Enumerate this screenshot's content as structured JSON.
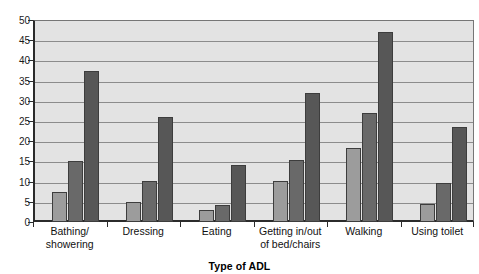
{
  "chart_data": {
    "type": "bar",
    "title": "",
    "xlabel": "Type of ADL",
    "ylabel": "",
    "ylim": [
      0,
      50
    ],
    "yticks": [
      0,
      5,
      10,
      15,
      20,
      25,
      30,
      35,
      40,
      45,
      50
    ],
    "ytick_labels": [
      "0",
      "5",
      "10",
      "15",
      "20",
      "25",
      "30",
      "35",
      "40",
      "45",
      "50"
    ],
    "grid": true,
    "legend": "none",
    "categories": [
      "Bathing/\nshowering",
      "Dressing",
      "Eating",
      "Getting in/out\nof bed/chairs",
      "Walking",
      "Using toilet"
    ],
    "category_lines": [
      [
        "Bathing/",
        "showering"
      ],
      [
        "Dressing",
        ""
      ],
      [
        "Eating",
        ""
      ],
      [
        "Getting in/out",
        "of bed/chairs"
      ],
      [
        "Walking",
        ""
      ],
      [
        "Using toilet",
        ""
      ]
    ],
    "series": [
      {
        "name": "series-1",
        "color": "#9c9c9c",
        "values": [
          7.5,
          5.0,
          3.0,
          10.2,
          18.3,
          4.5
        ]
      },
      {
        "name": "series-2",
        "color": "#696969",
        "values": [
          15.0,
          10.1,
          4.3,
          15.3,
          27.0,
          9.7
        ]
      },
      {
        "name": "series-3",
        "color": "#575757",
        "values": [
          37.5,
          26.0,
          14.0,
          32.0,
          47.0,
          23.5
        ]
      }
    ]
  },
  "colors": {
    "plot_background": "#e3e3e3",
    "page_background": "#ffffff",
    "gridline": "#8c8c8c",
    "axis": "#2b2b2b",
    "bar_edge": "#3d3d3d"
  },
  "axis_title": {
    "text": "Type of ADL"
  }
}
